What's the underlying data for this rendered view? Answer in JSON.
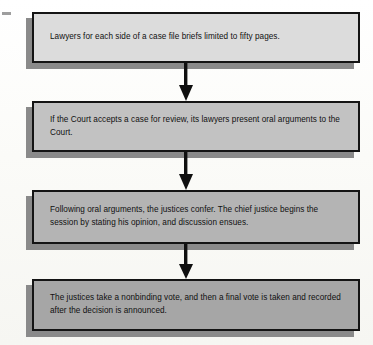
{
  "diagram": {
    "type": "flowchart",
    "orientation": "vertical-top-to-bottom",
    "background_color": "#fdfdfb",
    "border_color": "#141414",
    "shadow_color": "#8a8a8a",
    "text_color": "#101010",
    "steps": [
      {
        "id": "step-1",
        "text": "Lawyers for each side of a case file briefs limited to fifty pages.",
        "fill": "#dcdcdc",
        "x": 32,
        "y": 12,
        "width": 328,
        "height": 51
      },
      {
        "id": "step-2",
        "text": "If the Court accepts a case for review, its lawyers present oral arguments to the Court.",
        "fill": "#c2c2c2",
        "x": 32,
        "y": 101,
        "width": 328,
        "height": 51
      },
      {
        "id": "step-3",
        "text": "Following oral arguments, the justices confer. The chief justice begins the session by stating his opinion, and discussion ensues.",
        "fill": "#b4b4b4",
        "x": 32,
        "y": 190,
        "width": 328,
        "height": 54
      },
      {
        "id": "step-4",
        "text": "The justices take a nonbinding vote, and then a final vote is taken and recorded after the decision is announced.",
        "fill": "#a6a6a6",
        "x": 32,
        "y": 279,
        "width": 328,
        "height": 52
      }
    ],
    "connectors": [
      {
        "id": "arrow-1",
        "from": "step-1",
        "to": "step-2",
        "direction": "down",
        "x": 185,
        "y": 63,
        "height": 38
      },
      {
        "id": "arrow-2",
        "from": "step-2",
        "to": "step-3",
        "direction": "down",
        "x": 185,
        "y": 152,
        "height": 38
      },
      {
        "id": "arrow-3",
        "from": "step-3",
        "to": "step-4",
        "direction": "down",
        "x": 185,
        "y": 244,
        "height": 35
      }
    ]
  }
}
